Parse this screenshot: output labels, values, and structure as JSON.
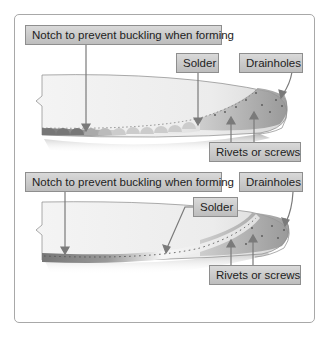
{
  "figure": {
    "panels": [
      {
        "id": "top",
        "labels": {
          "notch": "Notch to prevent buckling when forming",
          "solder": "Solder",
          "drainholes": "Drainholes",
          "rivets": "Rivets or screws"
        }
      },
      {
        "id": "bottom",
        "labels": {
          "notch": "Notch to prevent buckling when forming",
          "solder": "Solder",
          "drainholes": "Drainholes",
          "rivets": "Rivets or screws"
        }
      }
    ],
    "colors": {
      "label_top": "#d9d9d9",
      "label_bottom": "#bdbdbd",
      "frame_border": "#a8a8a8",
      "leader_line": "#7a7a7a",
      "metal_dark": "#8a8a8a",
      "metal_light": "#f2f2f2"
    }
  }
}
